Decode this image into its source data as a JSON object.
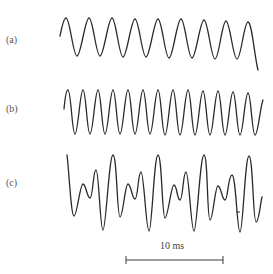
{
  "figure": {
    "panels": [
      {
        "label": "(a)",
        "description": "sinusoidal waveform, lower frequency",
        "cycles_visible": 9
      },
      {
        "label": "(b)",
        "description": "sinusoidal waveform, higher frequency",
        "cycles_visible": 13
      },
      {
        "label": "(c)",
        "description": "complex waveform (sum of components)",
        "repeating_pattern_cycles": 4
      }
    ],
    "scale_bar": {
      "label": "10 ms"
    },
    "colors": {
      "stroke": "#2a2a2a",
      "background": "#ffffff"
    }
  },
  "waves": {
    "a": "M60,36 C62,26 64,18 66,18 C70,18 73,56 77,56 C81,56 85,18 89,18 C93,18 96,56 100,56 C104,56 108,18 112,18 C116,18 119,57 123,57 C127,57 131,19 135,19 C139,19 142,57 146,57 C150,57 154,19 158,19 C162,19 165,58 169,58 C173,58 177,19 181,19 C185,19 188,58 192,58 C196,58 200,20 204,20 C208,20 211,59 215,59 C219,59 222,21 226,21 C230,21 233,59 237,59 C241,59 244,22 248,22 C252,22 255,60 258,70",
    "b": "M64,109 C65,98 66,90 68,90 C71,90 72,134 75,134 C78,134 80,90 83,90 C86,90 87,134 90,134 C93,134 95,90 98,90 C101,90 102,134 105,134 C108,134 110,90 113,90 C116,90 117,134 120,134 C123,134 125,90 128,90 C131,90 132,134 135,134 C138,134 140,90 143,90 C146,90 147,134 150,134 C153,134 155,90 158,90 C161,90 162,135 165,135 C168,135 170,90 173,90 C176,90 177,135 180,135 C183,135 185,90 188,90 C191,90 192,135 195,135 C198,135 200,91 203,91 C206,91 207,135 210,135 C213,135 215,91 218,91 C221,91 222,135 225,135 C228,135 230,92 233,92 C236,92 237,135 240,135 C243,135 245,93 248,93 C251,93 252,135 255,135 C258,135 260,108 263,100",
    "c": "M67,155 C69,170 71,216 74,216 C77,216 80,184 83,184 C86,184 87,198 90,198 C93,198 93,170 96,170 C99,170 100,230 103,230 C106,230 109,155 113,155 C117,155 117,217 120,217 C123,217 125,184 128,184 C131,184 132,199 135,199 C138,199 138,172 141,172 C144,172 146,231 149,231 C152,231 154,155 158,155 C162,155 162,218 165,218 C168,218 171,185 174,185 C177,185 177,200 180,200 C183,200 183,172 186,172 C189,172 191,231 194,231 C197,231 200,155 204,155 C208,155 207,220 210,220 C213,220 215,186 218,186 C221,186 222,200 225,200 C228,200 228,175 232,175 C236,175 237,232 240,232 C243,232 245,156 249,156 C253,156 253,222 256,222 C259,222 260,205 262,197"
  }
}
